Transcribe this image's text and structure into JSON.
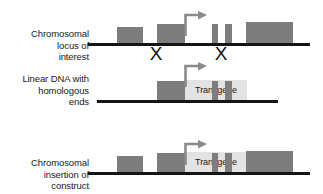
{
  "figure": {
    "colors": {
      "line": "#151515",
      "feature_box": "#7d7d7d",
      "transgene_box": "#e3e3e3",
      "text": "#1a1a1a",
      "background": "#ffffff"
    }
  },
  "rows": [
    {
      "id": "chromosomal-locus",
      "label": "Chromosomal\nlocus of\ninterest",
      "line": {
        "x": 88,
        "y": 43,
        "width": 222
      },
      "features": [
        {
          "name": "exon-1",
          "x": 117,
          "y": 27,
          "width": 26,
          "height": 16
        },
        {
          "name": "exon-2",
          "x": 157,
          "y": 24,
          "width": 28,
          "height": 19
        },
        {
          "name": "exon-3-narrow-a",
          "x": 212,
          "y": 24,
          "width": 6,
          "height": 19
        },
        {
          "name": "exon-3-narrow-b",
          "x": 225,
          "y": 24,
          "width": 7,
          "height": 19
        },
        {
          "name": "exon-4",
          "x": 246,
          "y": 22,
          "width": 47,
          "height": 21
        }
      ],
      "promoter": {
        "x": 185,
        "y": 12,
        "width": 23,
        "height": 22
      },
      "crossovers": [
        {
          "name": "crossover-left",
          "x": 148,
          "y": 44
        },
        {
          "name": "crossover-right",
          "x": 213,
          "y": 44
        }
      ]
    },
    {
      "id": "linear-dna",
      "label": "Linear DNA with\nhomologous\nends",
      "line": {
        "x": 97,
        "y": 100,
        "width": 181
      },
      "features": [
        {
          "name": "homology-arm-left",
          "x": 157,
          "y": 81,
          "width": 28,
          "height": 19
        },
        {
          "name": "homology-arm-narrow-a",
          "x": 212,
          "y": 81,
          "width": 6,
          "height": 19
        },
        {
          "name": "homology-arm-narrow-b",
          "x": 225,
          "y": 81,
          "width": 7,
          "height": 19
        }
      ],
      "transgene": {
        "label": "Transgene",
        "x": 185,
        "y": 80,
        "width": 62,
        "height": 20
      },
      "promoter": {
        "x": 185,
        "y": 69,
        "width": 23,
        "height": 22
      },
      "crossovers": []
    },
    {
      "id": "chromosomal-insertion",
      "label": "Chromosomal\ninsertion of\nconstruct",
      "line": {
        "x": 88,
        "y": 172,
        "width": 222
      },
      "features": [
        {
          "name": "exon-1",
          "x": 117,
          "y": 156,
          "width": 26,
          "height": 16
        },
        {
          "name": "exon-2",
          "x": 157,
          "y": 153,
          "width": 28,
          "height": 19
        },
        {
          "name": "exon-3-narrow-a",
          "x": 212,
          "y": 153,
          "width": 6,
          "height": 19
        },
        {
          "name": "exon-3-narrow-b",
          "x": 225,
          "y": 153,
          "width": 7,
          "height": 19
        },
        {
          "name": "exon-4",
          "x": 246,
          "y": 151,
          "width": 47,
          "height": 21
        }
      ],
      "transgene": {
        "label": "Transgene",
        "x": 185,
        "y": 152,
        "width": 62,
        "height": 20
      },
      "promoter": {
        "x": 185,
        "y": 141,
        "width": 23,
        "height": 22
      },
      "crossovers": []
    }
  ],
  "labels": {
    "row1": "Chromosomal\nlocus of\ninterest",
    "row2": "Linear DNA with\nhomologous\nends",
    "row3": "Chromosomal\ninsertion of\nconstruct",
    "transgene": "Transgene",
    "crossover_glyph": "X"
  }
}
